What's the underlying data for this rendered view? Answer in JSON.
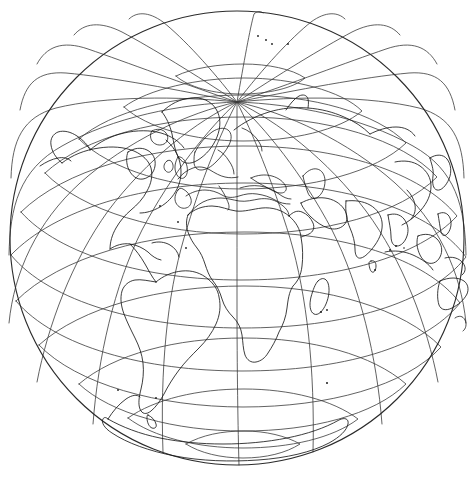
{
  "figure": {
    "name": "world-globe-orthographic",
    "background_color": "#ffffff",
    "line_color": "#1a1a1a",
    "graticule_color": "#3a3a3a",
    "width": 474,
    "height": 478
  },
  "chart_data": {
    "type": "map",
    "projection": "orthographic",
    "title": "",
    "subtitle": "",
    "xlabel": "",
    "ylabel": "",
    "center": {
      "latitude": 30,
      "longitude": 20
    },
    "globe": {
      "cx": 237,
      "cy": 238,
      "radius": 227
    },
    "pole_north_screen": {
      "x": 237,
      "y": 102
    },
    "graticule": {
      "visible": true,
      "latitude_step_deg": 15,
      "longitude_step_deg": 15,
      "parallels": [
        75,
        60,
        45,
        30,
        15,
        0,
        -15,
        -30,
        -45,
        -60,
        -75
      ],
      "meridians": [
        -160,
        -145,
        -130,
        -115,
        -100,
        -85,
        -70,
        -55,
        -40,
        -25,
        -10,
        5,
        20,
        35,
        50,
        65,
        80,
        95,
        110,
        125,
        140,
        155,
        170
      ],
      "equator_deg": 0,
      "labels_shown": false
    },
    "features": [
      "Africa",
      "Europe",
      "Asia",
      "North America",
      "South America",
      "Australia",
      "Antarctica",
      "Greenland",
      "Madagascar",
      "Indonesia",
      "Japan",
      "British Isles",
      "Scandinavia",
      "Iceland",
      "New Zealand"
    ],
    "visible_hemisphere": "Africa-Europe centred (Atlantic to Indian Ocean)",
    "coastlines_shown": true,
    "borders_shown": false,
    "legend": {
      "visible": false,
      "position": "none",
      "entries": []
    },
    "annotations": []
  },
  "accessibility": {
    "alt_text": "Line drawing of the Earth in orthographic projection centred near 30 degrees north, 20 degrees east, with a 15 degree graticule and world coastlines."
  }
}
